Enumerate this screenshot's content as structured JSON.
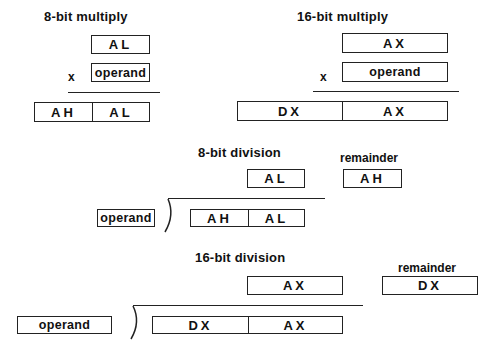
{
  "mul8": {
    "title": "8-bit multiply",
    "multiplicand": "AL",
    "operator": "x",
    "operand": "operand",
    "result": [
      "AH",
      "AL"
    ]
  },
  "mul16": {
    "title": "16-bit multiply",
    "multiplicand": "AX",
    "operator": "x",
    "operand": "operand",
    "result": [
      "DX",
      "AX"
    ]
  },
  "div8": {
    "title": "8-bit division",
    "quotient": "AL",
    "remainder_label": "remainder",
    "remainder": "AH",
    "divisor": "operand",
    "dividend": [
      "AH",
      "AL"
    ]
  },
  "div16": {
    "title": "16-bit division",
    "quotient": "AX",
    "remainder_label": "remainder",
    "remainder": "DX",
    "divisor": "operand",
    "dividend": [
      "DX",
      "AX"
    ]
  }
}
